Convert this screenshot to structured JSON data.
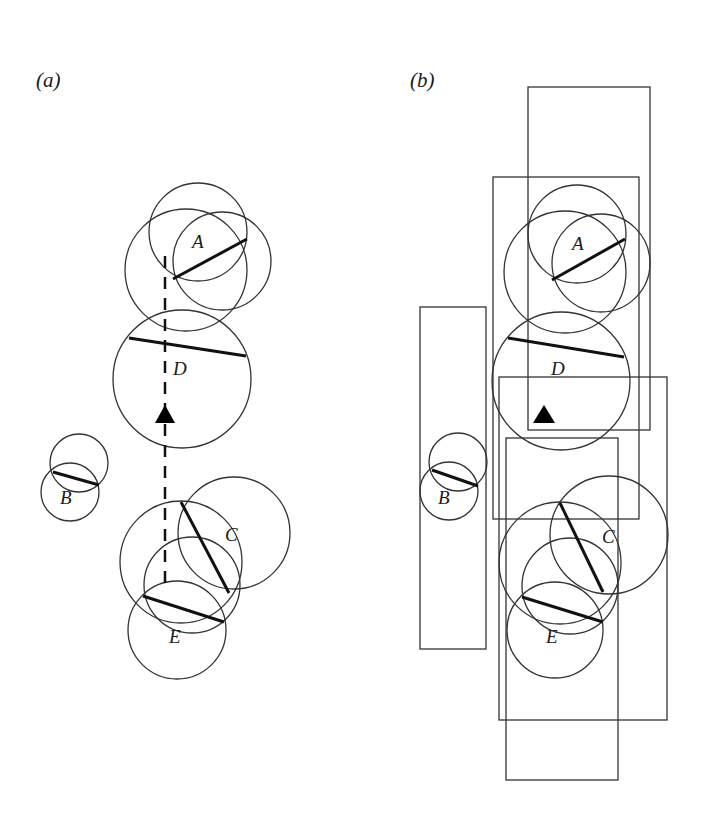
{
  "panels": [
    {
      "id": "a",
      "label": "(a)",
      "nodes": [
        {
          "name": "A",
          "label": "A"
        },
        {
          "name": "B",
          "label": "B"
        },
        {
          "name": "C",
          "label": "C"
        },
        {
          "name": "D",
          "label": "D"
        },
        {
          "name": "E",
          "label": "E"
        }
      ],
      "has_dashed_path": true,
      "marker": "filled-triangle"
    },
    {
      "id": "b",
      "label": "(b)",
      "nodes": [
        {
          "name": "A",
          "label": "A"
        },
        {
          "name": "B",
          "label": "B"
        },
        {
          "name": "C",
          "label": "C"
        },
        {
          "name": "D",
          "label": "D"
        },
        {
          "name": "E",
          "label": "E"
        }
      ],
      "bounding_rectangles": 6,
      "marker": "filled-triangle"
    }
  ],
  "colors": {
    "stroke": "#333333",
    "marker": "#000000",
    "background": "#ffffff"
  }
}
